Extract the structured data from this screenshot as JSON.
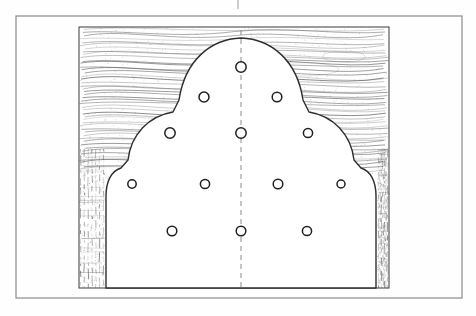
{
  "page": {
    "background_color": "#fefefe",
    "line_color": "#3a3a3a",
    "grain_color": "#555555",
    "centerline_color": "#7a7a7a"
  },
  "frame": {
    "name": "page-border",
    "x": 16,
    "y": 16,
    "width": 446,
    "height": 282,
    "stroke": "#8a8a8a",
    "stroke_width": 1.2
  },
  "top_tick": {
    "name": "registration-tick",
    "x": 238,
    "y1": 0,
    "y2": 9,
    "stroke": "#9a9a9a"
  },
  "drawing_box": {
    "name": "stock-outline",
    "x": 79,
    "y": 27,
    "width": 310,
    "height": 261,
    "stroke": "#4a4a4a",
    "stroke_width": 1.1
  },
  "panel": {
    "name": "scalloped-panel",
    "description": "Three-lobed ogee arch panel profile",
    "fill": "#ffffff",
    "stroke": "#2e2e2e",
    "stroke_width": 1.4,
    "apex_x": 241,
    "apex_y": 38,
    "base_y": 288,
    "left_edge_x": 93,
    "right_edge_x": 376
  },
  "centerline": {
    "name": "vertical-centerline",
    "x": 241,
    "y_top": 30,
    "y_bottom": 288,
    "dash": "5,4",
    "stroke": "#808080",
    "stroke_width": 0.9
  },
  "holes": {
    "name": "drilled-hole-pattern",
    "stroke": "#1f1f1f",
    "fill": "#ffffff",
    "count": 14,
    "rows": [
      {
        "row": 1,
        "cy": 67,
        "items": [
          {
            "cx": 241,
            "r": 5.2
          }
        ]
      },
      {
        "row": 2,
        "cy": 97,
        "items": [
          {
            "cx": 204,
            "r": 5.0
          },
          {
            "cx": 277,
            "r": 4.8
          }
        ]
      },
      {
        "row": 3,
        "cy": 133,
        "items": [
          {
            "cx": 170,
            "r": 5.2
          },
          {
            "cx": 241,
            "r": 5.2
          },
          {
            "cx": 308,
            "r": 4.6
          }
        ]
      },
      {
        "row": 4,
        "cy": 184,
        "items": [
          {
            "cx": 132,
            "r": 4.2
          },
          {
            "cx": 205,
            "r": 4.6
          },
          {
            "cx": 278,
            "r": 4.8
          },
          {
            "cx": 341,
            "r": 4.0
          }
        ]
      },
      {
        "row": 5,
        "cy": 231,
        "items": [
          {
            "cx": 172,
            "r": 4.8
          },
          {
            "cx": 241,
            "r": 4.8
          },
          {
            "cx": 307,
            "r": 4.6
          }
        ]
      }
    ]
  },
  "hatching": {
    "face_grain": {
      "name": "long-grain-hatch",
      "region": "top background between panel arch and stock outline",
      "stroke": "#5a5a5a",
      "style": "wavy horizontal wood grain figure"
    },
    "edge_grain": {
      "name": "end-grain-hatch",
      "region": "left and right vertical margins",
      "stroke": "#5a5a5a",
      "style": "short broken vertical ticks"
    }
  }
}
